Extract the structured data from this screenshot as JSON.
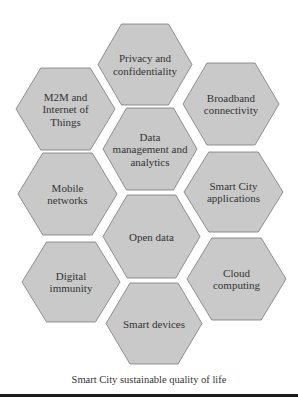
{
  "diagram": {
    "colors": {
      "hex_fill": "#c9c9c9",
      "hex_stroke": "#7a7a7a",
      "text": "#333333",
      "bottom_bar": "#1a1a1a"
    },
    "hexagons": [
      {
        "id": "privacy",
        "lines": [
          "Privacy and",
          "confidentiality"
        ],
        "cx": 145,
        "cy": 64,
        "top": 24,
        "bottom": 105,
        "left": 98,
        "right": 192
      },
      {
        "id": "m2m",
        "lines": [
          "M2M and",
          "Internet of",
          "Things"
        ],
        "cx": 66,
        "cy": 109,
        "top": 68,
        "bottom": 150,
        "left": 16,
        "right": 115
      },
      {
        "id": "broadband",
        "lines": [
          "Broadband",
          "connectivity"
        ],
        "cx": 231,
        "cy": 104,
        "top": 63,
        "bottom": 145,
        "left": 183,
        "right": 279
      },
      {
        "id": "data-mgmt",
        "lines": [
          "Data",
          "management and",
          "analytics"
        ],
        "cx": 150,
        "cy": 149,
        "top": 108,
        "bottom": 190,
        "left": 103,
        "right": 197
      },
      {
        "id": "mobile",
        "lines": [
          "Mobile",
          "networks"
        ],
        "cx": 68,
        "cy": 194,
        "top": 153,
        "bottom": 235,
        "left": 18,
        "right": 117
      },
      {
        "id": "smart-city-apps",
        "lines": [
          "Smart City",
          "applications"
        ],
        "cx": 233,
        "cy": 192,
        "top": 152,
        "bottom": 232,
        "left": 184,
        "right": 283
      },
      {
        "id": "open-data",
        "lines": [
          "Open data"
        ],
        "cx": 151,
        "cy": 236,
        "top": 195,
        "bottom": 278,
        "left": 103,
        "right": 200
      },
      {
        "id": "digital-immunity",
        "lines": [
          "Digital",
          "immunity"
        ],
        "cx": 71,
        "cy": 282,
        "top": 242,
        "bottom": 322,
        "left": 22,
        "right": 120
      },
      {
        "id": "cloud",
        "lines": [
          "Cloud",
          "computing"
        ],
        "cx": 236,
        "cy": 279,
        "top": 238,
        "bottom": 320,
        "left": 187,
        "right": 286
      },
      {
        "id": "smart-devices",
        "lines": [
          "Smart devices"
        ],
        "cx": 151,
        "cy": 323,
        "top": 283,
        "bottom": 364,
        "left": 106,
        "right": 202
      }
    ],
    "caption": "Smart City sustainable quality of life"
  }
}
